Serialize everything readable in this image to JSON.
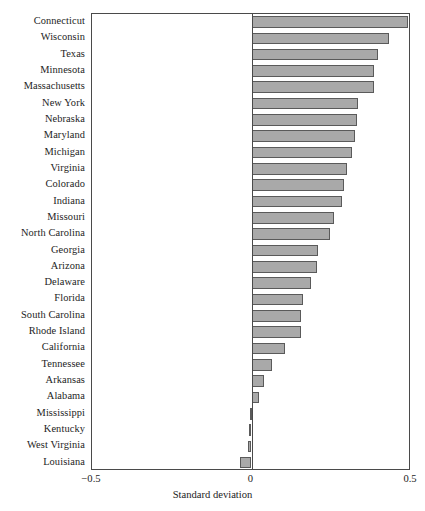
{
  "chart_data": {
    "type": "bar",
    "orientation": "horizontal",
    "title": "",
    "subtitle": "",
    "xlabel": "Standard deviation",
    "ylabel": "",
    "xlim": [
      -0.5,
      0.5
    ],
    "xticks": [
      -0.5,
      0,
      0.5
    ],
    "xtick_labels": [
      "−0.5",
      "0",
      "0.5"
    ],
    "grid": false,
    "legend": null,
    "bar_color": "#a9a9a9",
    "bar_edge_color": "#5a5a5a",
    "frame_color": "#4a4a4a",
    "categories": [
      "Connecticut",
      "Wisconsin",
      "Texas",
      "Minnesota",
      "Massachusetts",
      "New York",
      "Nebraska",
      "Maryland",
      "Michigan",
      "Virginia",
      "Colorado",
      "Indiana",
      "Missouri",
      "North Carolina",
      "Georgia",
      "Arizona",
      "Delaware",
      "Florida",
      "South Carolina",
      "Rhode Island",
      "California",
      "Tennessee",
      "Arkansas",
      "Alabama",
      "Mississippi",
      "Kentucky",
      "West Virginia",
      "Louisiana"
    ],
    "values": [
      0.49,
      0.43,
      0.395,
      0.385,
      0.385,
      0.335,
      0.33,
      0.325,
      0.315,
      0.3,
      0.29,
      0.285,
      0.26,
      0.245,
      0.21,
      0.205,
      0.185,
      0.16,
      0.155,
      0.155,
      0.105,
      0.065,
      0.04,
      0.025,
      -0.005,
      -0.007,
      -0.012,
      -0.035
    ]
  },
  "axis": {
    "tick_left": "−0.5",
    "tick_zero": "0",
    "tick_right": "0.5",
    "title": "Standard deviation"
  }
}
